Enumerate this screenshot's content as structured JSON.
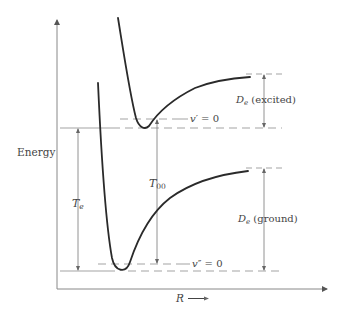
{
  "diagram": {
    "type": "potential-energy-curves",
    "y_axis_label": "Energy",
    "x_axis_label": "R",
    "x_axis_arrow": "⟶",
    "curves": [
      {
        "name": "excited-state",
        "level_label": "v′ = 0"
      },
      {
        "name": "ground-state",
        "level_label": "v″ = 0"
      }
    ],
    "labels": {
      "te_main": "T",
      "te_sub": "e",
      "t00_main": "T",
      "t00_sub": "00",
      "de_excited_main": "D",
      "de_excited_sub": "e",
      "de_excited_text": " (excited)",
      "de_ground_main": "D",
      "de_ground_sub": "e",
      "de_ground_text": " (ground)",
      "v_excited_var": "v",
      "v_excited_rest": "′ = 0",
      "v_ground_var": "v",
      "v_ground_rest": "″ = 0"
    },
    "colors": {
      "curve": "#2a2a2a",
      "axis": "#777777",
      "guide": "#999999",
      "text": "#444444"
    }
  }
}
